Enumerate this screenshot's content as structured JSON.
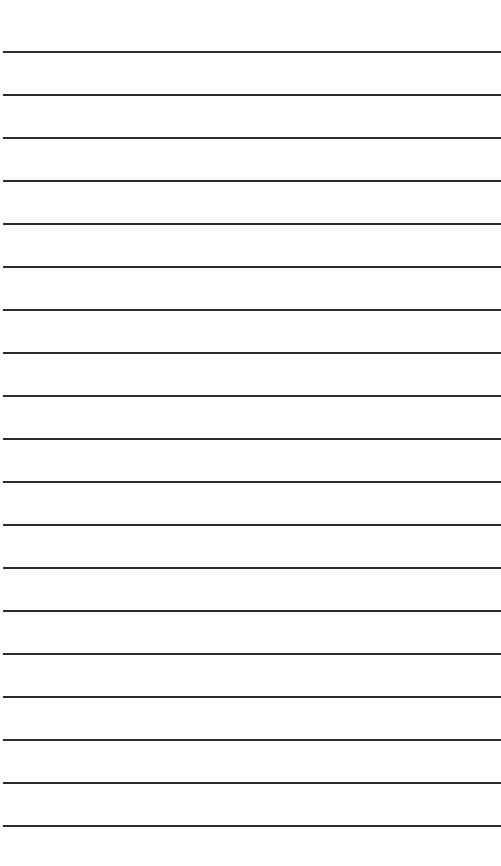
{
  "page": {
    "kind": "lined-paper",
    "line_count": 19,
    "line_color": "#2b2b2b",
    "background_color": "#ffffff"
  }
}
